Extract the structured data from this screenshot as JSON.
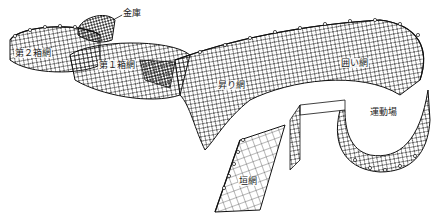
{
  "diagram": {
    "type": "fixed-net-fishing-trap-illustration",
    "labels": [
      {
        "id": "kinko",
        "text": "金庫",
        "x": 122,
        "y": 8
      },
      {
        "id": "hakoami2",
        "text": "第２箱網",
        "x": 14,
        "y": 48
      },
      {
        "id": "hakoami1",
        "text": "第１箱網",
        "x": 98,
        "y": 60
      },
      {
        "id": "noboriami",
        "text": "昇り網",
        "x": 217,
        "y": 80
      },
      {
        "id": "kakoiami",
        "text": "囲い網",
        "x": 340,
        "y": 58
      },
      {
        "id": "undoujou",
        "text": "運動場",
        "x": 369,
        "y": 107
      },
      {
        "id": "kakiami",
        "text": "垣網",
        "x": 238,
        "y": 176
      }
    ],
    "colors": {
      "line": "#1a1a1a",
      "background": "#ffffff"
    }
  }
}
